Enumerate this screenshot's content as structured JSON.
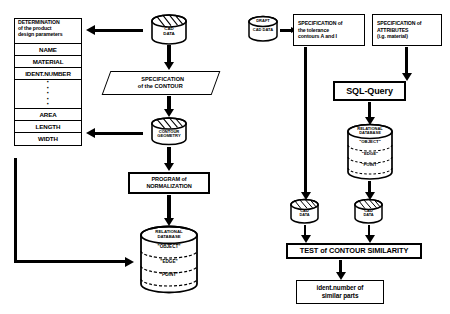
{
  "diagram": {
    "left_branch": {
      "attribute_table": {
        "header_lines": [
          "DETERMINATION",
          "of the product",
          "design  parameters"
        ],
        "rows": [
          "NAME",
          "MATERIAL",
          "IDENT.NUMBER"
        ],
        "ellipsis": "·",
        "rows_lower": [
          "AREA",
          "LENGTH",
          "WIDTH"
        ]
      },
      "cad_data_cylinder": {
        "line1": "CAD",
        "line2": "DATA"
      },
      "specification_contour": {
        "line1": "SPECIFICATION",
        "line2": "of the CONTOUR"
      },
      "contour_geometry_cylinder": {
        "line1": "CONTOUR",
        "line2": "GEOMETRY"
      },
      "program_normalization": {
        "line1": "PROGRAM of",
        "line2": "NORMALIZATION"
      },
      "relational_database": {
        "title1": "RELATIONAL",
        "title2": "DATABASE",
        "segments": [
          "\"OBJECT\"",
          "\"EDGE\"",
          "\"POINT\""
        ]
      }
    },
    "right_branch": {
      "draft_cad_cylinder": {
        "line1": "DRAFT",
        "line2": "CAD DATA"
      },
      "specification_tolerance": {
        "lines": [
          "SPECIFICATION of",
          "the  tolerance",
          "contours A and I"
        ]
      },
      "specification_attributes": {
        "lines": [
          "SPECIFICATION of",
          "ATTRIBUTES",
          "(i.g.  material)"
        ]
      },
      "sql_query": {
        "label": "SQL-Query"
      },
      "relational_database": {
        "title1": "RELATIONAL",
        "title2": "DATABASE",
        "segments": [
          "\"OBJECT\"",
          "\"EDGE\"",
          "\"POINT\""
        ]
      },
      "cad_data_left_cylinder": {
        "line1": "CAD",
        "line2": "DATA"
      },
      "cad_data_right_cylinder": {
        "line1": "CAD",
        "line2": "DATA"
      },
      "test_contour_similarity": {
        "label": "TEST of CONTOUR SIMILARITY"
      },
      "result": {
        "line1": "ident.number of",
        "line2": "similar  parts"
      }
    },
    "colors": {
      "ink": "#000000",
      "paper": "#ffffff"
    }
  }
}
